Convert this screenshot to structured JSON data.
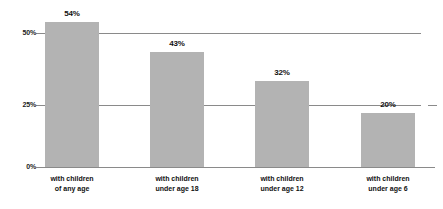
{
  "chart_data": {
    "type": "bar",
    "title": "",
    "subtitle": "",
    "xlabel": "",
    "ylabel": "",
    "grid": true,
    "legend": "none",
    "ylim": [
      0,
      57
    ],
    "yticks": [
      "0%",
      "25%",
      "50%"
    ],
    "ytick_values": [
      0,
      25,
      50
    ],
    "categories": [
      "with children of any age",
      "with children under age 18",
      "with children under age 12",
      "with children under age 6"
    ],
    "category_lines": [
      {
        "line1": "with children",
        "line2": "of any age"
      },
      {
        "line1": "with children",
        "line2": "under age 18"
      },
      {
        "line1": "with children",
        "line2": "under age 12"
      },
      {
        "line1": "with children",
        "line2": "under age 6"
      }
    ],
    "values": [
      54,
      43,
      32,
      20
    ],
    "value_labels": [
      "54%",
      "43%",
      "32%",
      "20%"
    ],
    "bar_color": "#b3b3b3",
    "axis_color": "#8a8a8a",
    "text_color": "#111111"
  }
}
